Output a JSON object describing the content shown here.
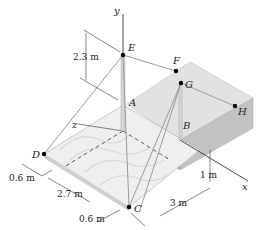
{
  "figure": {
    "points": {
      "A": "A",
      "B": "B",
      "C": "C",
      "D": "D",
      "E": "E",
      "F": "F",
      "G": "G",
      "H": "H"
    },
    "axes": {
      "x": "x",
      "y": "y",
      "z": "z"
    },
    "dimensions": {
      "ae_height": "2.3 m",
      "d_offset": "0.6 m",
      "dc_span": "2.7 m",
      "c_offset": "0.6 m",
      "b_offset_x": "3 m",
      "b_height": "1 m"
    },
    "colors": {
      "box_top": "#e2e2e2",
      "box_front": "#b8b8b8",
      "box_side": "#c9c9c9",
      "plate": "#eeeeee",
      "cable": "#9a9a9a",
      "point": "#000000"
    }
  }
}
